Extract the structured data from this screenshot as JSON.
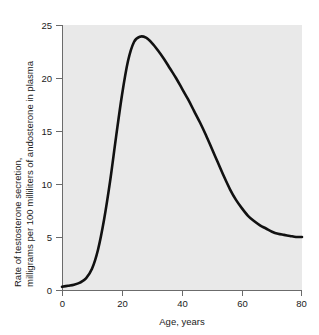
{
  "chart_data": {
    "type": "line",
    "title": "",
    "xlabel": "Age, years",
    "ylabel": "Rate of testosterone secretion, milligrams per 100 milliliters of andosterone in plasma",
    "ylabel_line1": "Rate of testosterone secretion,",
    "ylabel_line2": "milligrams per 100 milliliters of andosterone in plasma",
    "xlim": [
      0,
      80
    ],
    "ylim": [
      0,
      25
    ],
    "xticks": [
      0,
      20,
      40,
      60,
      80
    ],
    "yticks": [
      0,
      5,
      10,
      15,
      20,
      25
    ],
    "xtick_labels": [
      "0",
      "20",
      "40",
      "60",
      "80"
    ],
    "ytick_labels": [
      "0",
      "5",
      "10",
      "15",
      "20",
      "25"
    ],
    "grid": false,
    "legend": false,
    "legend_position": "none",
    "series": [
      {
        "name": "Testosterone secretion rate",
        "color": "#111111",
        "x": [
          0,
          2,
          4,
          6,
          8,
          10,
          12,
          14,
          16,
          18,
          20,
          22,
          24,
          26,
          28,
          30,
          32,
          34,
          36,
          38,
          40,
          42,
          44,
          46,
          48,
          50,
          52,
          54,
          56,
          58,
          60,
          62,
          64,
          66,
          68,
          70,
          72,
          74,
          76,
          78,
          80
        ],
        "y": [
          0.3,
          0.4,
          0.5,
          0.7,
          1.1,
          2.0,
          3.8,
          6.6,
          10.2,
          14.4,
          18.4,
          21.6,
          23.4,
          23.9,
          23.8,
          23.3,
          22.6,
          21.8,
          20.9,
          20.0,
          19.0,
          18.0,
          16.9,
          15.8,
          14.6,
          13.3,
          12.0,
          10.7,
          9.5,
          8.5,
          7.7,
          7.0,
          6.5,
          6.1,
          5.8,
          5.5,
          5.3,
          5.2,
          5.1,
          5.0,
          5.0
        ]
      }
    ],
    "annotations": {
      "peak_value": 23.9,
      "peak_age": 26,
      "plateau_value": 5.0,
      "baseline_value": 0.3
    },
    "colors": {
      "curve": "#111111",
      "plot_background": "#e9e9e9",
      "axis": "#6b6b6b",
      "text": "#1a1a1a",
      "figure_background": "#ffffff"
    }
  }
}
